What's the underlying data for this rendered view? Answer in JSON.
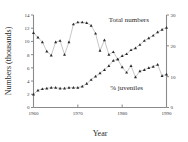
{
  "chart_data": {
    "type": "line",
    "title": "",
    "xlabel": "Year",
    "ylabel": "Numbers (thousands)",
    "ylabel_right": "",
    "xlim": [
      1960,
      1990
    ],
    "ylim": [
      0,
      14
    ],
    "ylim_right": [
      0,
      30
    ],
    "xticks": [
      1960,
      1970,
      1980,
      1990
    ],
    "xticklabels": [
      "1960",
      "1970",
      "1980",
      "1990"
    ],
    "yticks": [
      0,
      2,
      4,
      6,
      8,
      10,
      12,
      14
    ],
    "yticklabels": [
      "0",
      "2",
      "4",
      "6",
      "8",
      "10",
      "12",
      "14"
    ],
    "yticks_right": [
      0,
      10,
      20,
      30
    ],
    "yticklabels_right": [
      "0",
      "10",
      "20",
      "30"
    ],
    "grid": false,
    "legend_position": "inline-annotations",
    "annotations": [
      {
        "text": "Total numbers",
        "x": 1981.5,
        "y": 12.9
      },
      {
        "text": "% juveniles",
        "x": 1981.0,
        "y": 2.6
      }
    ],
    "series": [
      {
        "name": "Total numbers",
        "axis": "left",
        "marker": "triangle",
        "color": "#2b2b2b",
        "x": [
          1960,
          1961,
          1962,
          1963,
          1964,
          1965,
          1966,
          1967,
          1968,
          1969,
          1970,
          1971,
          1972,
          1973,
          1974,
          1975,
          1976,
          1977,
          1978,
          1979,
          1980,
          1981,
          1982,
          1983,
          1984,
          1985,
          1986,
          1987,
          1988,
          1989,
          1990
        ],
        "values": [
          11.3,
          10.6,
          9.9,
          8.5,
          7.9,
          9.9,
          10.1,
          8.0,
          9.9,
          12.6,
          12.9,
          12.9,
          12.8,
          12.4,
          11.2,
          8.6,
          10.2,
          8.0,
          8.4,
          7.3,
          6.1,
          5.3,
          6.3,
          4.6,
          5.5,
          5.7,
          6.0,
          6.2,
          6.5,
          4.8,
          5.0
        ]
      },
      {
        "name": "% juveniles",
        "axis": "right",
        "marker": "triangle",
        "color": "#2b2b2b",
        "x": [
          1960,
          1961,
          1962,
          1963,
          1964,
          1965,
          1966,
          1967,
          1968,
          1969,
          1970,
          1971,
          1972,
          1973,
          1974,
          1975,
          1976,
          1977,
          1978,
          1979,
          1980,
          1981,
          1982,
          1983,
          1984,
          1985,
          1986,
          1987,
          1988,
          1989,
          1990
        ],
        "values": [
          4.3,
          5.5,
          6.0,
          6.2,
          6.4,
          6.4,
          6.2,
          6.2,
          6.4,
          6.4,
          6.5,
          6.8,
          7.8,
          9.0,
          10.0,
          11.2,
          12.2,
          13.6,
          15.2,
          15.6,
          16.8,
          17.4,
          18.6,
          19.3,
          20.4,
          21.6,
          22.6,
          23.4,
          24.4,
          25.3,
          25.9
        ],
        "values_left_equiv": [
          2.0,
          2.6,
          2.8,
          2.9,
          3.0,
          3.0,
          2.9,
          2.9,
          3.0,
          3.0,
          3.0,
          3.2,
          3.6,
          4.2,
          4.7,
          5.2,
          5.7,
          6.3,
          7.1,
          7.3,
          7.8,
          8.1,
          8.7,
          9.0,
          9.5,
          10.1,
          10.5,
          10.9,
          11.4,
          11.8,
          12.1
        ]
      }
    ]
  }
}
